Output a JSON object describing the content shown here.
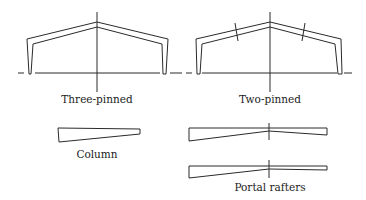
{
  "figure": {
    "labels": {
      "three_pinned": "Three-pinned",
      "two_pinned": "Two-pinned",
      "column": "Column",
      "portal_rafters": "Portal rafters"
    },
    "frames": [
      {
        "id": "three-pinned",
        "hinges": [
          "left-base",
          "right-base",
          "apex"
        ]
      },
      {
        "id": "two-pinned",
        "hinges": [
          "left-base",
          "right-base"
        ],
        "rafter_splices": 2
      }
    ],
    "members": [
      {
        "id": "column",
        "taper": "tapered"
      },
      {
        "id": "portal-rafter-1",
        "taper": "tapered both halves"
      },
      {
        "id": "portal-rafter-2",
        "taper": "tapered left half, uniform right half"
      }
    ]
  }
}
